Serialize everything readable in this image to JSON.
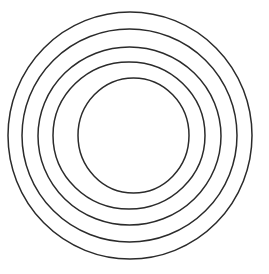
{
  "figure": {
    "name": "concentric-circles",
    "background_color": "#ffffff",
    "stroke_color": "#2b2b2b",
    "stroke_width": 1.5,
    "canvas": {
      "width": 269,
      "height": 274
    },
    "ring_count": 5,
    "fill": "none"
  },
  "chart_data": {
    "type": "scatter",
    "xlabel": "",
    "ylabel": "",
    "xlim": [
      0,
      269
    ],
    "ylim": [
      0,
      274
    ],
    "grid": false,
    "legend": "none",
    "shape": "ellipse-outline",
    "rings": [
      {
        "index": 1,
        "label": "outer-ring",
        "cx": 130,
        "cy": 135.5,
        "rx": 122,
        "ry": 123.5,
        "diameter_x": 244,
        "diameter_y": 247,
        "x_span": [
          8,
          252
        ],
        "y_span": [
          12,
          259
        ],
        "stroke": "#2b2b2b"
      },
      {
        "index": 2,
        "label": "second-ring",
        "cx": 129.5,
        "cy": 135.5,
        "rx": 107.5,
        "ry": 106.5,
        "diameter_x": 215,
        "diameter_y": 213,
        "x_span": [
          22,
          237
        ],
        "y_span": [
          29,
          242
        ],
        "stroke": "#2b2b2b"
      },
      {
        "index": 3,
        "label": "third-ring",
        "cx": 129.5,
        "cy": 136,
        "rx": 91.5,
        "ry": 89,
        "diameter_x": 183,
        "diameter_y": 178,
        "x_span": [
          38,
          221
        ],
        "y_span": [
          47,
          225
        ],
        "stroke": "#2b2b2b"
      },
      {
        "index": 4,
        "label": "fourth-ring",
        "cx": 129,
        "cy": 135.5,
        "rx": 76,
        "ry": 73.5,
        "diameter_x": 152,
        "diameter_y": 147,
        "x_span": [
          53,
          205
        ],
        "y_span": [
          62,
          209
        ],
        "stroke": "#2b2b2b"
      },
      {
        "index": 5,
        "label": "inner-ring",
        "cx": 133.5,
        "cy": 135.5,
        "rx": 55.5,
        "ry": 57.5,
        "diameter_x": 111,
        "diameter_y": 115,
        "x_span": [
          78,
          189
        ],
        "y_span": [
          78,
          193
        ],
        "stroke": "#2b2b2b"
      }
    ]
  }
}
